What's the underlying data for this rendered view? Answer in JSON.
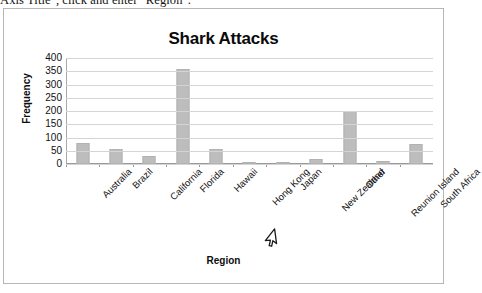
{
  "instruction": {
    "text": "Axis Title\", click and enter \"Region\"."
  },
  "chart": {
    "title": "Shark Attacks",
    "xlabel": "Region",
    "ylabel": "Frequency",
    "cursor_icon": "mouse-pointer-arrow-icon",
    "colors": {
      "bar_fill": "#bdbdbd",
      "bar_border": "#b2b2b2",
      "gridline": "#d4d4d4",
      "axis": "#9a9a9a",
      "frame_border": "#b6b6b6",
      "text": "#111111"
    }
  },
  "chart_data": {
    "type": "bar",
    "title": "Shark Attacks",
    "xlabel": "Region",
    "ylabel": "Frequency",
    "ylim": [
      0,
      400
    ],
    "yticks": [
      400,
      350,
      300,
      250,
      200,
      150,
      100,
      50,
      0
    ],
    "grid": true,
    "legend": false,
    "categories": [
      "Australia",
      "Brazil",
      "California",
      "Florida",
      "Hawaii",
      "Hong Kong",
      "Japan",
      "New Zealand",
      "Other",
      "Reunion Island",
      "South Africa"
    ],
    "values": [
      80,
      55,
      30,
      360,
      55,
      2,
      1,
      18,
      200,
      10,
      75
    ]
  }
}
